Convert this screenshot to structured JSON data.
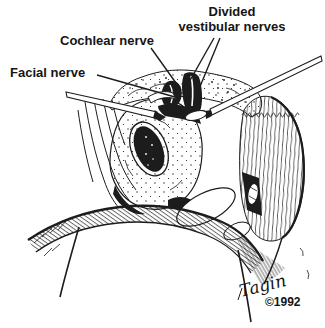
{
  "illustration": {
    "description": "surgical-anatomy-line-drawing",
    "background_color": "#ffffff",
    "ink_color": "#1c1c1c",
    "labels": {
      "divided_vestibular": {
        "line1": "Divided",
        "line2": "vestibular nerves"
      },
      "cochlear": "Cochlear nerve",
      "facial": "Facial nerve"
    },
    "credit": {
      "signature": "Tagin",
      "copyright": "©1992"
    }
  }
}
